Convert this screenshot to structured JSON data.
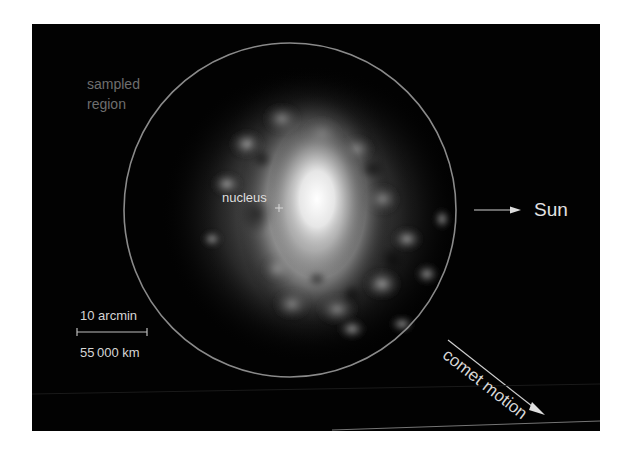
{
  "figure": {
    "type": "astronomical image of comet coma",
    "labels": {
      "sampled_region_line1": "sampled",
      "sampled_region_line2": "region",
      "nucleus": "nucleus",
      "sun": "Sun",
      "comet_motion": "comet motion",
      "scale_angular": "10 arcmin",
      "scale_distance": "55 000 km"
    },
    "markers": {
      "nucleus_marker": "+",
      "sun_direction": "right",
      "motion_direction": "down-right"
    },
    "colors": {
      "background": "#020202",
      "circle": "#8a8a8a",
      "text": "#d6d6d6",
      "dim_text": "#6e6e6e"
    }
  }
}
